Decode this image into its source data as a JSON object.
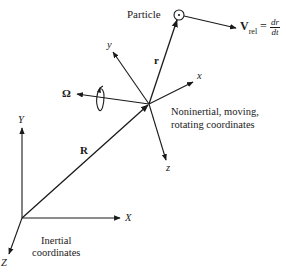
{
  "figure": {
    "particle_label": "Particle",
    "velocity": {
      "symbol": "V",
      "subscript": "rel",
      "equals": "=",
      "numerator": "dr",
      "denominator": "dt"
    },
    "position_vector_rel": "r",
    "position_vector_origin": "R",
    "angular_velocity": "Ω",
    "rotating_axes": {
      "x": "x",
      "y": "y",
      "z": "z"
    },
    "rotating_frame_caption_line1": "Noninertial, moving,",
    "rotating_frame_caption_line2": "rotating coordinates",
    "inertial_axes": {
      "X": "X",
      "Y": "Y",
      "Z": "Z"
    },
    "inertial_caption_line1": "Inertial",
    "inertial_caption_line2": "coordinates",
    "colors": {
      "ink": "#1a1a1a",
      "background": "#ffffff"
    }
  }
}
